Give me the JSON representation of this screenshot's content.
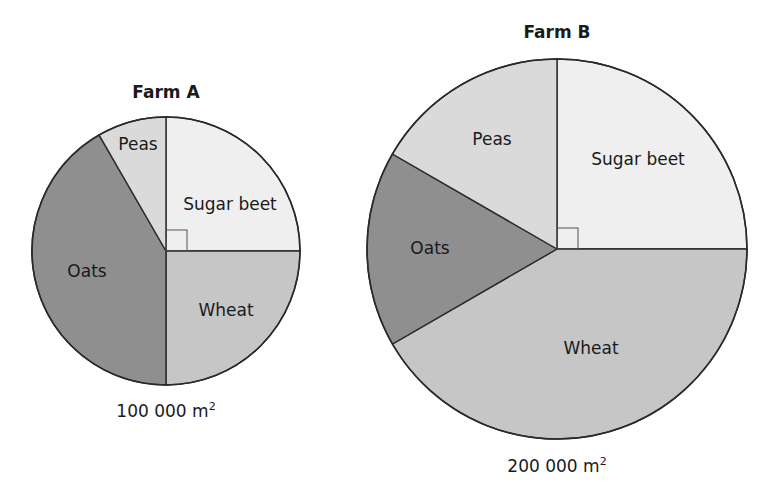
{
  "chart_data": [
    {
      "type": "pie",
      "title": "Farm A",
      "total_area_label": "100 000 m",
      "total_area_unit_sup": "2",
      "total_area_m2": 100000,
      "layout": {
        "cx": 166,
        "cy": 251,
        "r": 134,
        "title_y": 82,
        "area_y": 400
      },
      "start_angle_deg": 0,
      "direction": "clockwise-from-top",
      "right_angle_marker": true,
      "slices": [
        {
          "label": "Sugar beet",
          "angle_deg": 90,
          "fraction": 0.25,
          "color": "#efefef",
          "label_x": 230,
          "label_y": 210
        },
        {
          "label": "Wheat",
          "angle_deg": 90,
          "fraction": 0.25,
          "color": "#c6c6c6",
          "label_x": 226,
          "label_y": 316
        },
        {
          "label": "Oats",
          "angle_deg": 150,
          "fraction": 0.4167,
          "color": "#8f8f8f",
          "label_x": 87,
          "label_y": 277
        },
        {
          "label": "Peas",
          "angle_deg": 30,
          "fraction": 0.0833,
          "color": "#dadada",
          "label_x": 138,
          "label_y": 150
        }
      ]
    },
    {
      "type": "pie",
      "title": "Farm B",
      "total_area_label": "200 000 m",
      "total_area_unit_sup": "2",
      "total_area_m2": 200000,
      "layout": {
        "cx": 557,
        "cy": 249,
        "r": 190,
        "title_y": 22,
        "area_y": 455
      },
      "start_angle_deg": 0,
      "direction": "clockwise-from-top",
      "right_angle_marker": true,
      "slices": [
        {
          "label": "Sugar beet",
          "angle_deg": 90,
          "fraction": 0.25,
          "color": "#efefef",
          "label_x": 638,
          "label_y": 165
        },
        {
          "label": "Wheat",
          "angle_deg": 150,
          "fraction": 0.4167,
          "color": "#c6c6c6",
          "label_x": 591,
          "label_y": 354
        },
        {
          "label": "Oats",
          "angle_deg": 60,
          "fraction": 0.1667,
          "color": "#8f8f8f",
          "label_x": 430,
          "label_y": 254
        },
        {
          "label": "Peas",
          "angle_deg": 60,
          "fraction": 0.1667,
          "color": "#dadada",
          "label_x": 492,
          "label_y": 145
        }
      ]
    }
  ]
}
